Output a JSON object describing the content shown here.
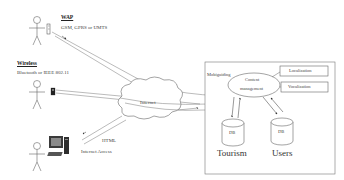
{
  "diagram": {
    "clients": [
      {
        "id": "wap",
        "header": "WAP",
        "subtitle": "GSM, GPRS or UMTS",
        "device": "mobile-phone"
      },
      {
        "id": "wireless",
        "header": "Wireless",
        "subtitle": "Bluetooth or IEEE 802.11",
        "device": "pda"
      },
      {
        "id": "internet-access",
        "header": "",
        "subtitle": "Internet Access",
        "device": "desktop-computer",
        "protocol": "HTML"
      }
    ],
    "network": {
      "label": "Internet"
    },
    "server": {
      "label": "Mobiguiding",
      "core": "Content management",
      "core_line1": "Content",
      "core_line2": "management",
      "modules": [
        "Localization",
        "Vocalization"
      ],
      "databases": [
        {
          "label": "DB",
          "name": "Tourism"
        },
        {
          "label": "DB",
          "name": "Users"
        }
      ]
    },
    "colors": {
      "line": "#555555",
      "box": "#666666",
      "text": "#333333",
      "background": "#ffffff"
    }
  }
}
